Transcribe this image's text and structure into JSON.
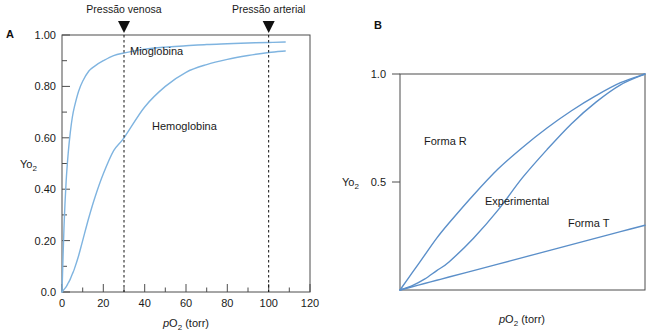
{
  "figure": {
    "panels": [
      {
        "id": "A",
        "label": "A",
        "axis": {
          "xlabel_italic": "p",
          "xlabel_rest": "O",
          "xlabel_sub": "2",
          "xlabel_unit": " (torr)",
          "xlabel_full": "pO2 (torr)",
          "ylabel_main": "Yo",
          "ylabel_sub": "2",
          "ylabel_full": "Yo2",
          "xticks": [
            "0",
            "20",
            "40",
            "60",
            "80",
            "100",
            "120"
          ],
          "xtick_values": [
            0,
            20,
            40,
            60,
            80,
            100,
            120
          ],
          "yticks": [
            "0.0",
            "0.20",
            "0.40",
            "0.60",
            "0.80",
            "1.00"
          ],
          "ytick_values": [
            0.0,
            0.2,
            0.4,
            0.6,
            0.8,
            1.0
          ],
          "xlim": [
            0,
            120
          ],
          "ylim": [
            0.0,
            1.0
          ],
          "xminor_step": 10,
          "yminor_step": 0.1
        },
        "markers": [
          {
            "name": "venous-pressure",
            "label": "Pressão venosa",
            "value": 30
          },
          {
            "name": "arterial-pressure",
            "label": "Pressão arterial",
            "value": 100
          }
        ],
        "curve_labels": [
          {
            "name": "myoglobin-label",
            "text": "Mioglobina"
          },
          {
            "name": "hemoglobin-label",
            "text": "Hemoglobina"
          }
        ]
      },
      {
        "id": "B",
        "label": "B",
        "axis": {
          "xlabel_full": "pO2 (torr)",
          "ylabel_main": "Yo",
          "ylabel_sub": "2",
          "yticks": [
            "1.0",
            "0.5"
          ],
          "ytick_values": [
            1.0,
            0.5
          ],
          "xlim": [
            0,
            100
          ],
          "ylim": [
            0.0,
            1.0
          ]
        },
        "curve_labels": [
          {
            "name": "forma-r-label",
            "text": "Forma R"
          },
          {
            "name": "experimental-label",
            "text": "Experimental"
          },
          {
            "name": "forma-t-label",
            "text": "Forma T"
          }
        ]
      }
    ]
  },
  "colors": {
    "curve_light_blue": "#7fb4e0",
    "curve_blue": "#5b8fc9",
    "frame": "#4d4d4d",
    "text": "#1a1a1a",
    "background": "#ffffff"
  },
  "chart_data": [
    {
      "type": "line",
      "title": "",
      "panel": "A",
      "xlabel": "pO2 (torr)",
      "ylabel": "Yo2",
      "xlim": [
        0,
        120
      ],
      "ylim": [
        0.0,
        1.0
      ],
      "grid": false,
      "legend": "inline-labels",
      "annotations": [
        {
          "text": "Pressão venosa",
          "x": 30,
          "type": "vertical-dashed-arrow"
        },
        {
          "text": "Pressão arterial",
          "x": 100,
          "type": "vertical-dashed-arrow"
        }
      ],
      "x": [
        0,
        1,
        2,
        3,
        4,
        5,
        6,
        8,
        10,
        13,
        16,
        20,
        25,
        30,
        40,
        50,
        60,
        70,
        80,
        90,
        100,
        108
      ],
      "series": [
        {
          "name": "Mioglobina",
          "color": "#7fb4e0",
          "values": [
            0.0,
            0.26,
            0.43,
            0.54,
            0.62,
            0.68,
            0.72,
            0.78,
            0.82,
            0.86,
            0.88,
            0.9,
            0.92,
            0.93,
            0.945,
            0.953,
            0.958,
            0.963,
            0.966,
            0.969,
            0.971,
            0.973
          ]
        },
        {
          "name": "Hemoglobina",
          "color": "#7fb4e0",
          "values": [
            0.0,
            0.01,
            0.02,
            0.035,
            0.05,
            0.07,
            0.09,
            0.14,
            0.2,
            0.29,
            0.37,
            0.46,
            0.55,
            0.6,
            0.72,
            0.8,
            0.855,
            0.885,
            0.905,
            0.92,
            0.932,
            0.938
          ]
        }
      ]
    },
    {
      "type": "line",
      "title": "",
      "panel": "B",
      "xlabel": "pO2 (torr)",
      "ylabel": "Yo2",
      "xlim": [
        0,
        100
      ],
      "ylim": [
        0.0,
        1.0
      ],
      "grid": false,
      "legend": "inline-labels",
      "x": [
        0,
        5,
        10,
        15,
        20,
        30,
        40,
        50,
        60,
        70,
        80,
        90,
        100
      ],
      "series": [
        {
          "name": "Forma R",
          "color": "#5b8fc9",
          "values": [
            0.0,
            0.08,
            0.16,
            0.24,
            0.31,
            0.44,
            0.56,
            0.66,
            0.75,
            0.83,
            0.9,
            0.96,
            1.0
          ]
        },
        {
          "name": "Experimental",
          "color": "#5b8fc9",
          "values": [
            0.0,
            0.02,
            0.05,
            0.09,
            0.13,
            0.24,
            0.37,
            0.52,
            0.65,
            0.77,
            0.87,
            0.95,
            1.0
          ]
        },
        {
          "name": "Forma T",
          "color": "#5b8fc9",
          "values": [
            0.0,
            0.015,
            0.03,
            0.045,
            0.06,
            0.09,
            0.12,
            0.15,
            0.18,
            0.21,
            0.24,
            0.27,
            0.3
          ]
        }
      ]
    }
  ]
}
